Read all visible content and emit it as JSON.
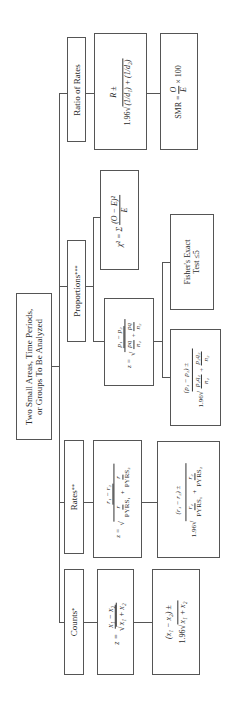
{
  "root": {
    "line1": "Two Small Areas, Time Periods,",
    "line2": "or Groups To Be Analyzed"
  },
  "categories": [
    {
      "id": "ratio-of-rates",
      "label": "Ratio of Rates",
      "mark": "",
      "children": [
        {
          "id": "ratio-ci",
          "line1": "R ±",
          "line2_prefix": "1.96",
          "line2_radicand": "(1/d₁) + (1/d₂)"
        },
        {
          "id": "smr",
          "lhs": "SMR =",
          "num": "O",
          "den": "E",
          "tail": "× 100"
        }
      ]
    },
    {
      "id": "proportions",
      "label": "Proportions",
      "mark": "***",
      "children": [
        {
          "id": "chi-square",
          "lhs": "χ² = Σ",
          "num": "(O − E)²",
          "den": "E"
        },
        {
          "id": "z-proportions",
          "lhs": "z =",
          "num": "p₁ − p₂",
          "den_a_num": "pq",
          "den_a_den": "n₁",
          "den_b_num": "pq",
          "den_b_den": "n₂"
        },
        {
          "id": "fisher",
          "line1": "Fisher's Exact",
          "line2": "Test ≤5"
        },
        {
          "id": "ci-proportions",
          "line1": "(p₁ − p₂) ±",
          "prefix": "1.96",
          "a_num": "p₁q₁",
          "a_den": "n₁",
          "b_num": "p₂q₂",
          "b_den": "n₂"
        }
      ]
    },
    {
      "id": "rates",
      "label": "Rates",
      "mark": "**",
      "children": [
        {
          "id": "z-rates",
          "lhs": "z =",
          "num": "r₁ − r₂",
          "a_num": "r",
          "a_den": "PYRS₁",
          "b_num": "r",
          "b_den": "PYRS₂"
        },
        {
          "id": "ci-rates",
          "line1": "(r₁ − r₂) ±",
          "prefix": "1.96",
          "a_num": "r₁",
          "a_den": "PYRS₁",
          "b_num": "r₂",
          "b_den": "PYRS₂"
        }
      ]
    },
    {
      "id": "counts",
      "label": "Counts",
      "mark": "*",
      "children": [
        {
          "id": "z-counts",
          "lhs": "z =",
          "num": "x₁ − x₂",
          "radicand": "x₁ + x₂"
        },
        {
          "id": "ci-counts",
          "line1": "(x₁ − x₂) ±",
          "prefix": "1.96",
          "radicand": "x₁ + x₂"
        }
      ]
    }
  ],
  "plus": "+",
  "radical": "√"
}
